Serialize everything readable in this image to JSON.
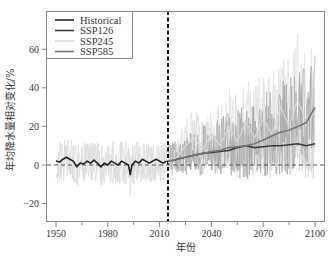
{
  "chart_data": {
    "type": "line",
    "title": "",
    "xlabel": "年份",
    "ylabel": "年均降水量相对变化/%",
    "xlim": [
      1945,
      2105
    ],
    "ylim": [
      -30,
      80
    ],
    "xticks": [
      1950,
      1980,
      2010,
      2040,
      2070,
      2100
    ],
    "xticks_minor": [
      1965,
      1995,
      2025,
      2055,
      2085
    ],
    "yticks": [
      -20,
      0,
      20,
      40,
      60
    ],
    "grid": false,
    "legend_position": "upper left",
    "reference_lines": [
      {
        "type": "horizontal",
        "value": 0,
        "style": "dashed",
        "color": "#555555"
      },
      {
        "type": "vertical",
        "value": 2015,
        "style": "dashed",
        "color": "#111111"
      }
    ],
    "series": [
      {
        "name": "Historical",
        "color": "#222222",
        "x": [
          1950,
          1952,
          1954,
          1956,
          1958,
          1960,
          1962,
          1964,
          1966,
          1968,
          1970,
          1972,
          1974,
          1976,
          1978,
          1980,
          1982,
          1984,
          1986,
          1988,
          1990,
          1992,
          1993,
          1994,
          1996,
          1998,
          2000,
          2002,
          2004,
          2006,
          2008,
          2010,
          2012,
          2014
        ],
        "values": [
          2,
          1.5,
          3,
          4,
          3,
          2,
          -1,
          1,
          0.5,
          2,
          1,
          2.5,
          1,
          -1,
          1,
          0,
          2,
          1,
          0,
          2,
          1,
          0,
          -5,
          0,
          2,
          1,
          3,
          2,
          1,
          2,
          3,
          2,
          1,
          2
        ]
      },
      {
        "name": "SSP126",
        "color": "#3a3a3a",
        "x": [
          2015,
          2020,
          2025,
          2030,
          2035,
          2040,
          2045,
          2050,
          2055,
          2060,
          2065,
          2070,
          2075,
          2080,
          2085,
          2090,
          2095,
          2100
        ],
        "values": [
          1.5,
          3,
          4,
          5,
          6,
          6.5,
          7,
          7.5,
          9,
          10,
          9,
          9.5,
          10,
          10,
          10.5,
          11,
          10,
          11
        ]
      },
      {
        "name": "SSP245",
        "color": "#d8d8d8",
        "x": [
          2015,
          2020,
          2025,
          2030,
          2035,
          2040,
          2045,
          2050,
          2055,
          2060,
          2065,
          2070,
          2075,
          2080,
          2085,
          2090,
          2095,
          2100
        ],
        "values": [
          1,
          4,
          10,
          14,
          8,
          16,
          10,
          20,
          12,
          22,
          14,
          24,
          16,
          30,
          20,
          34,
          22,
          28
        ]
      },
      {
        "name": "SSP585",
        "color": "#777777",
        "x": [
          2015,
          2020,
          2025,
          2030,
          2035,
          2040,
          2045,
          2050,
          2055,
          2060,
          2065,
          2070,
          2075,
          2080,
          2085,
          2090,
          2095,
          2100
        ],
        "values": [
          2,
          3,
          4,
          5,
          6,
          7,
          7.5,
          9,
          9.5,
          10,
          11,
          13,
          15,
          17,
          18,
          20,
          22,
          30
        ]
      }
    ]
  },
  "legend": {
    "items": [
      {
        "label": "Historical",
        "color": "#222222"
      },
      {
        "label": "SSP126",
        "color": "#3a3a3a"
      },
      {
        "label": "SSP245",
        "color": "#d8d8d8"
      },
      {
        "label": "SSP585",
        "color": "#777777"
      }
    ]
  },
  "axes": {
    "xlabel": "年份",
    "ylabel": "年均降水量相对变化/%",
    "xtick_labels": [
      "1950",
      "1980",
      "2010",
      "2040",
      "2070",
      "2100"
    ],
    "ytick_labels": [
      "-20",
      "0",
      "20",
      "40",
      "60"
    ]
  }
}
